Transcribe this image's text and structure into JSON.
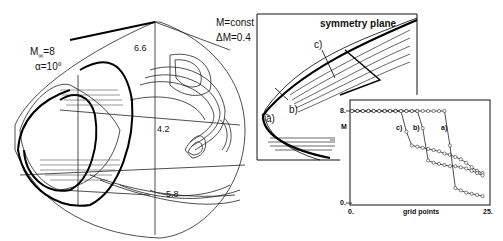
{
  "figure": {
    "left_panel": {
      "title_mach": "M∞=8",
      "title_mach_base": "M",
      "title_mach_sub": "∞",
      "title_mach_val": "=8",
      "title_alpha": "α=10°",
      "contour_labels": [
        "6.6",
        "4.2",
        "5.8"
      ]
    },
    "middle_panel": {
      "label_const": "M=const",
      "label_delta": "ΔM=0.4",
      "label_symmetry": "symmetry plane",
      "cuts": [
        "a)",
        "b)",
        "c)"
      ]
    },
    "inset": {
      "ylabel": "M",
      "ytick_top": "8.",
      "ytick_bottom": "0.",
      "xtick_left": "0.",
      "xtick_right": "25.",
      "xlabel": "grid points",
      "series_labels": [
        "c)",
        "b)",
        "a)"
      ]
    }
  },
  "chart_data": {
    "type": "line",
    "title": "",
    "xlabel": "grid points",
    "ylabel": "M",
    "xlim": [
      0,
      25
    ],
    "ylim": [
      0,
      8
    ],
    "xticks": [
      "0.",
      "25."
    ],
    "yticks": [
      "0.",
      "8."
    ],
    "grid": false,
    "legend": "inline labels a), b), c)",
    "series": [
      {
        "name": "c)",
        "x": [
          0,
          1,
          2,
          3,
          4,
          5,
          6,
          7,
          8,
          9,
          10,
          11,
          12,
          13,
          14,
          15,
          16,
          17,
          18,
          19,
          20,
          21,
          22,
          23,
          24
        ],
        "values": [
          8,
          8,
          8,
          8,
          8,
          8,
          8,
          8,
          8,
          8,
          6.2,
          5.0,
          4.9,
          4.8,
          4.7,
          4.6,
          4.5,
          4.3,
          4.2,
          4.0,
          3.8,
          3.5,
          3.1,
          2.8,
          2.6
        ]
      },
      {
        "name": "b)",
        "x": [
          0,
          1,
          2,
          3,
          4,
          5,
          6,
          7,
          8,
          9,
          10,
          11,
          12,
          13,
          14,
          15,
          16,
          17,
          18,
          19,
          20,
          21,
          22,
          23,
          24
        ],
        "values": [
          8,
          8,
          8,
          8,
          8,
          8,
          8,
          8,
          8,
          8,
          8,
          8,
          8,
          6.5,
          3.7,
          3.5,
          3.4,
          3.3,
          3.2,
          3.2,
          3.1,
          3.0,
          2.8,
          2.6,
          2.4
        ]
      },
      {
        "name": "a)",
        "x": [
          0,
          1,
          2,
          3,
          4,
          5,
          6,
          7,
          8,
          9,
          10,
          11,
          12,
          13,
          14,
          15,
          16,
          17,
          18,
          19,
          20,
          21,
          22,
          23,
          24
        ],
        "values": [
          8,
          8,
          8,
          8,
          8,
          8,
          8,
          8,
          8,
          8,
          8,
          8,
          8,
          8,
          8,
          8,
          8,
          8,
          5.0,
          1.3,
          1.1,
          0.9,
          0.8,
          0.7,
          0.6
        ]
      }
    ]
  }
}
